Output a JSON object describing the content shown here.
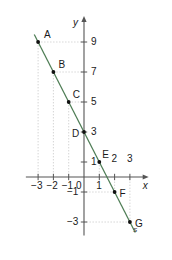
{
  "figure": {
    "kind": "coordinate-plane-line-graph",
    "background": "#ffffff",
    "line_color": "#4e7d55",
    "axis_color": "#555555",
    "guide_color": "#c9c9c9",
    "point_color": "#111111",
    "text_color": "#1a1a1a"
  },
  "axes": {
    "x_label": "x",
    "y_label": "y",
    "x_tick_labels": [
      "−3",
      "−2",
      "−1",
      "0",
      "1",
      "2",
      "3"
    ],
    "x_tick_values": [
      -3,
      -2,
      -1,
      0,
      1,
      2,
      3
    ],
    "y_tick_labels": [
      "9",
      "7",
      "5",
      "3",
      "1",
      "−1",
      "−3"
    ],
    "y_tick_values": [
      9,
      7,
      5,
      3,
      1,
      -1,
      -3
    ],
    "x_range": [
      -3.8,
      3.9
    ],
    "y_range": [
      -3.9,
      10.4
    ],
    "unit_px_x": 15.3,
    "unit_px_y": 15.0,
    "origin_px": [
      84,
      177
    ]
  },
  "line": {
    "name": "s",
    "label": "s",
    "equation": "y = -2x + 3",
    "slope": -2,
    "intercept": 3,
    "from": [
      -3.25,
      9.5
    ],
    "to": [
      3.35,
      -3.7
    ]
  },
  "points": [
    {
      "label": "A",
      "x": -3,
      "y": 9,
      "label_dx": 6,
      "label_dy": -12
    },
    {
      "label": "B",
      "x": -2,
      "y": 7,
      "label_dx": 5,
      "label_dy": -12
    },
    {
      "label": "C",
      "x": -1,
      "y": 5,
      "label_dx": 4,
      "label_dy": -12
    },
    {
      "label": "D",
      "x": 0,
      "y": 3,
      "label_dx": -12,
      "label_dy": -3
    },
    {
      "label": "E",
      "x": 1,
      "y": 1,
      "label_dx": 3,
      "label_dy": -12
    },
    {
      "label": "F",
      "x": 2,
      "y": -1,
      "label_dx": 5,
      "label_dy": -3
    },
    {
      "label": "G",
      "x": 3,
      "y": -3,
      "label_dx": 5,
      "label_dy": -3
    }
  ],
  "guides": {
    "vertical_at_x": [
      -3,
      -2,
      -1,
      1,
      2,
      3
    ],
    "horizontal_at_y": [
      9,
      7,
      5,
      -1,
      -3
    ]
  },
  "chart_data": {
    "type": "line",
    "title": "",
    "xlabel": "x",
    "ylabel": "y",
    "x": [
      -3,
      -2,
      -1,
      0,
      1,
      2,
      3
    ],
    "series": [
      {
        "name": "s",
        "values": [
          9,
          7,
          5,
          3,
          1,
          -1,
          -3
        ]
      }
    ],
    "point_labels": [
      "A",
      "B",
      "C",
      "D",
      "E",
      "F",
      "G"
    ],
    "xlim": [
      -3.8,
      3.9
    ],
    "ylim": [
      -3.9,
      10.4
    ],
    "grid": false,
    "legend": "none"
  }
}
